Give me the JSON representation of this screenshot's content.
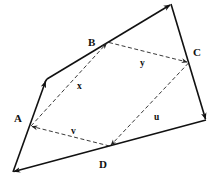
{
  "diagram": {
    "type": "vector-quadrilateral",
    "points": {
      "A": "A",
      "B": "B",
      "C": "C",
      "D": "D"
    },
    "vectors": {
      "x": "x",
      "y": "y",
      "u": "u",
      "v": "v"
    },
    "edges": [
      {
        "from": "bottom-left",
        "to": "left-kink",
        "style": "solid",
        "arrow": true
      },
      {
        "from": "left-kink",
        "to": "top",
        "style": "solid",
        "arrow": true
      },
      {
        "from": "top",
        "to": "right",
        "style": "solid",
        "arrow": true
      },
      {
        "from": "right",
        "to": "bottom-left",
        "style": "solid",
        "arrow": true
      }
    ],
    "dashed_vectors": [
      {
        "label": "x",
        "from": "A",
        "to": "B"
      },
      {
        "label": "y",
        "from": "B",
        "to": "C"
      },
      {
        "label": "u",
        "from": "C",
        "to": "D"
      },
      {
        "label": "v",
        "from": "D",
        "to": "A"
      }
    ]
  }
}
